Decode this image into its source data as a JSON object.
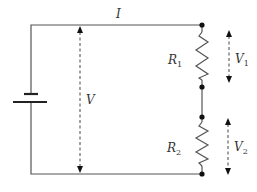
{
  "diagram": {
    "type": "series-resistor-circuit",
    "labels": {
      "current": "I",
      "total_voltage": "V",
      "resistor1": {
        "main": "R",
        "sub": "1"
      },
      "resistor2": {
        "main": "R",
        "sub": "2"
      },
      "voltage1": {
        "main": "V",
        "sub": "1"
      },
      "voltage2": {
        "main": "V",
        "sub": "2"
      }
    },
    "components": [
      "battery",
      "resistor R1",
      "resistor R2",
      "3 junction nodes"
    ],
    "colors": {
      "wire": "#555555",
      "node": "#111111",
      "text": "#333333"
    }
  }
}
